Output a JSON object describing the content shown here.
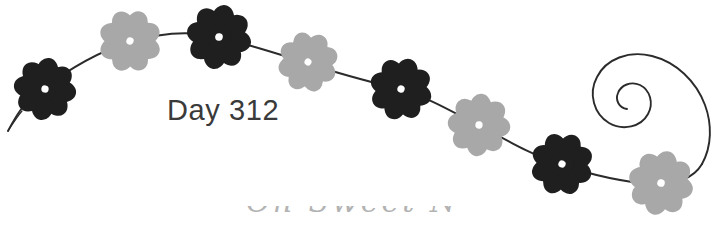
{
  "canvas": {
    "width": 728,
    "height": 225,
    "background": "#ffffff"
  },
  "artwork": {
    "title": "Day 312",
    "description": "Decorative flower vine with spiral flourish",
    "vine_color": "#2b2b2b",
    "vine_width": 1.9,
    "flower_dark_color": "#1f1f1f",
    "flower_light_color": "#a8a8a8",
    "flower_center_color": "#ffffff",
    "text_color": "#3a3a3a"
  },
  "day_label": {
    "text": "Day 312",
    "x": 167,
    "y": 96,
    "font_size": 29
  },
  "bottom_script": {
    "text": "Oh Sweet Nature",
    "visible": "partial-top-edge-only",
    "color": "#9a9a9a"
  },
  "flowers": [
    {
      "id": 1,
      "cx": 45,
      "cy": 89,
      "r": 27,
      "petals": 8,
      "tone": "dark",
      "rotation": 8
    },
    {
      "id": 2,
      "cx": 130,
      "cy": 41,
      "r": 27,
      "petals": 8,
      "tone": "light",
      "rotation": 22
    },
    {
      "id": 3,
      "cx": 219,
      "cy": 37,
      "r": 28,
      "petals": 8,
      "tone": "dark",
      "rotation": 12
    },
    {
      "id": 4,
      "cx": 308,
      "cy": 62,
      "r": 26,
      "petals": 8,
      "tone": "light",
      "rotation": 30
    },
    {
      "id": 5,
      "cx": 401,
      "cy": 89,
      "r": 27,
      "petals": 8,
      "tone": "dark",
      "rotation": 18
    },
    {
      "id": 6,
      "cx": 479,
      "cy": 125,
      "r": 27,
      "petals": 8,
      "tone": "light",
      "rotation": 5
    },
    {
      "id": 7,
      "cx": 562,
      "cy": 164,
      "r": 27,
      "petals": 8,
      "tone": "dark",
      "rotation": 25
    },
    {
      "id": 8,
      "cx": 661,
      "cy": 183,
      "r": 28,
      "petals": 8,
      "tone": "light",
      "rotation": 14
    }
  ],
  "vine_path": {
    "start": {
      "x": 8,
      "y": 131
    },
    "end_spiral_center": {
      "x": 648,
      "y": 78
    },
    "spiral_turns": 1.75
  }
}
